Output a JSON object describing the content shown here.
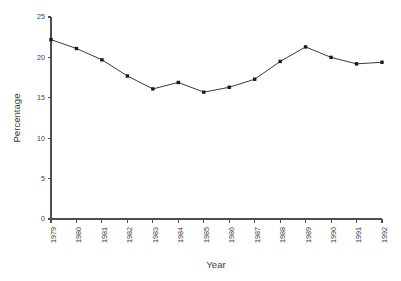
{
  "chart_data": {
    "type": "line",
    "title": "",
    "xlabel": "Year",
    "ylabel": "Percentage",
    "categories": [
      "1979",
      "1980",
      "1981",
      "1982",
      "1983",
      "1984",
      "1985",
      "1986",
      "1987",
      "1988",
      "1989",
      "1990",
      "1991",
      "1992"
    ],
    "values": [
      22.2,
      21.1,
      19.7,
      17.7,
      16.1,
      16.9,
      15.7,
      16.3,
      17.3,
      19.5,
      21.3,
      20.0,
      19.2,
      19.4
    ],
    "series": [
      {
        "name": "Percentage",
        "values": [
          22.2,
          21.1,
          19.7,
          17.7,
          16.1,
          16.9,
          15.7,
          16.3,
          17.3,
          19.5,
          21.3,
          20.0,
          19.2,
          19.4
        ]
      }
    ],
    "ylim": [
      0,
      25
    ],
    "yticks": [
      0,
      5,
      10,
      15,
      20,
      25
    ],
    "ytick_labels": [
      "0",
      "5",
      "10",
      "15",
      "20",
      "25"
    ],
    "xtick_labels": [
      "1979",
      "1980",
      "1981",
      "1982",
      "1983",
      "1984",
      "1985",
      "1986",
      "1987",
      "1988",
      "1989",
      "1990",
      "1991",
      "1992"
    ],
    "xtick_rotation": 90,
    "grid": false,
    "legend": false,
    "legend_position": "none",
    "marker": "square",
    "line_color": "#3a3a3a",
    "marker_color": "#1a1a1a",
    "axis_color": "#4d4d4d",
    "background": "#ffffff"
  },
  "axis_titles": {
    "x": "Year",
    "y": "Percentage"
  }
}
